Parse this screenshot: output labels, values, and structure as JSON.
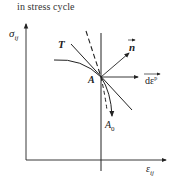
{
  "caption": "in stress cycle",
  "axes": {
    "y_label_main": "σ",
    "y_label_sub": "ij",
    "x_label_main": "ε",
    "x_label_sub": "ij"
  },
  "labels": {
    "T": "T",
    "n": "n",
    "A": "A",
    "A0_main": "A",
    "A0_sub": "0",
    "dep_main": "dε",
    "dep_sup": "p"
  },
  "colors": {
    "ink": "#222222",
    "background": "#ffffff"
  }
}
